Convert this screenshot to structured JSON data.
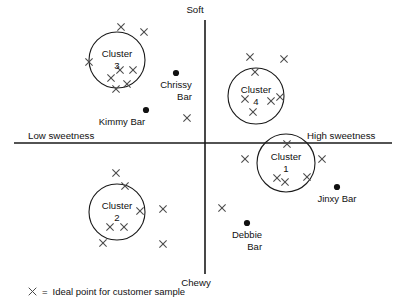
{
  "chart_data": {
    "type": "scatter",
    "title": "",
    "xlabel": "Sweetness",
    "ylabel": "Texture",
    "axis_labels": {
      "top": "Soft",
      "bottom": "Chewy",
      "left": "Low sweetness",
      "right": "High sweetness"
    },
    "axis_origin": {
      "x": 205,
      "y": 143
    },
    "legend": {
      "marker": "x",
      "equals": "=",
      "text": "Ideal point for customer sample"
    },
    "clusters": [
      {
        "id": "cluster-1",
        "label_line1": "Cluster",
        "label_line2": "1",
        "cx": 286,
        "cy": 163,
        "r": 29
      },
      {
        "id": "cluster-2",
        "label_line1": "Cluster",
        "label_line2": "2",
        "cx": 117,
        "cy": 212,
        "r": 28
      },
      {
        "id": "cluster-3",
        "label_line1": "Cluster",
        "label_line2": "3",
        "cx": 117,
        "cy": 60,
        "r": 28
      },
      {
        "id": "cluster-4",
        "label_line1": "Cluster",
        "label_line2": "4",
        "cx": 256,
        "cy": 96,
        "r": 28
      }
    ],
    "brands": [
      {
        "name": "Chrissy Bar",
        "line1": "Chrissy",
        "line2": "Bar",
        "x": 176,
        "y": 73,
        "label_x": 176,
        "label_y": 79
      },
      {
        "name": "Kimmy Bar",
        "line1": "Kimmy Bar",
        "line2": "",
        "x": 146,
        "y": 110,
        "label_x": 122,
        "label_y": 116
      },
      {
        "name": "Jinxy Bar",
        "line1": "Jinxy Bar",
        "line2": "",
        "x": 337,
        "y": 187,
        "label_x": 337,
        "label_y": 193
      },
      {
        "name": "Debbie Bar",
        "line1": "Debbie",
        "line2": "Bar",
        "x": 247,
        "y": 223,
        "label_x": 247,
        "label_y": 229
      }
    ],
    "ideal_points": [
      {
        "x": 121,
        "y": 27
      },
      {
        "x": 144,
        "y": 32
      },
      {
        "x": 89,
        "y": 62
      },
      {
        "x": 120,
        "y": 70
      },
      {
        "x": 133,
        "y": 70
      },
      {
        "x": 111,
        "y": 78
      },
      {
        "x": 127,
        "y": 84
      },
      {
        "x": 116,
        "y": 89
      },
      {
        "x": 250,
        "y": 57
      },
      {
        "x": 284,
        "y": 59
      },
      {
        "x": 255,
        "y": 72
      },
      {
        "x": 245,
        "y": 99
      },
      {
        "x": 271,
        "y": 101
      },
      {
        "x": 280,
        "y": 97
      },
      {
        "x": 253,
        "y": 112
      },
      {
        "x": 187,
        "y": 118
      },
      {
        "x": 287,
        "y": 144
      },
      {
        "x": 245,
        "y": 159
      },
      {
        "x": 322,
        "y": 159
      },
      {
        "x": 277,
        "y": 178
      },
      {
        "x": 285,
        "y": 182
      },
      {
        "x": 307,
        "y": 177
      },
      {
        "x": 116,
        "y": 173
      },
      {
        "x": 125,
        "y": 186
      },
      {
        "x": 140,
        "y": 211
      },
      {
        "x": 163,
        "y": 209
      },
      {
        "x": 110,
        "y": 227
      },
      {
        "x": 124,
        "y": 227
      },
      {
        "x": 103,
        "y": 243
      },
      {
        "x": 163,
        "y": 244
      },
      {
        "x": 222,
        "y": 208
      }
    ]
  }
}
